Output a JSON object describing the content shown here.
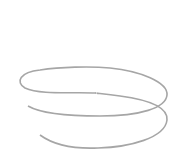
{
  "figure": {
    "type": "3D helix (space curve)",
    "axes": {
      "z": {
        "label": "z",
        "tick_count": 8
      },
      "x": {
        "label": "x",
        "tick_count": 3
      },
      "y": {
        "label": "y",
        "tick_count": 3
      }
    },
    "point_label": "(3, 0, 0)",
    "colors": {
      "curve": "#a0a0a0",
      "axis": "#333333",
      "background": "#ffffff"
    }
  }
}
